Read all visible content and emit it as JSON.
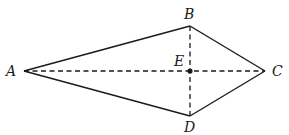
{
  "figure": {
    "type": "kite quadrilateral with diagonals",
    "points": {
      "A": {
        "label": "A",
        "x": 24,
        "y": 71
      },
      "B": {
        "label": "B",
        "x": 190,
        "y": 26
      },
      "C": {
        "label": "C",
        "x": 265,
        "y": 71
      },
      "D": {
        "label": "D",
        "x": 190,
        "y": 116
      },
      "E": {
        "label": "E",
        "x": 190,
        "y": 71
      }
    },
    "solid_segments": [
      "AB",
      "BC",
      "CD",
      "DA"
    ],
    "dashed_segments": [
      "AC",
      "BD"
    ],
    "marked_point": "E",
    "colors": {
      "stroke": "#1a1a1a",
      "background": "#ffffff"
    }
  }
}
